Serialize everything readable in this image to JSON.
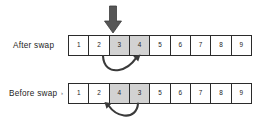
{
  "diagram": {
    "background_color": "#ffffff",
    "border_color": "#2b2b2b",
    "shaded_cell_color": "#d2d2d2",
    "arrow_color": "#4d4d4d",
    "curve_arrow_color": "#3a3a3a",
    "label_tick": "›"
  },
  "rows": [
    {
      "id": "after",
      "label": "After swap",
      "cells": [
        {
          "value": "1",
          "shaded": false
        },
        {
          "value": "2",
          "shaded": false
        },
        {
          "value": "3",
          "shaded": true
        },
        {
          "value": "4",
          "shaded": true
        },
        {
          "value": "5",
          "shaded": false
        },
        {
          "value": "6",
          "shaded": false
        },
        {
          "value": "7",
          "shaded": false
        },
        {
          "value": "8",
          "shaded": false
        },
        {
          "value": "9",
          "shaded": false
        }
      ]
    },
    {
      "id": "before",
      "label": "Before swap",
      "cells": [
        {
          "value": "1",
          "shaded": false
        },
        {
          "value": "2",
          "shaded": false
        },
        {
          "value": "4",
          "shaded": true
        },
        {
          "value": "3",
          "shaded": true
        },
        {
          "value": "5",
          "shaded": false
        },
        {
          "value": "6",
          "shaded": false
        },
        {
          "value": "7",
          "shaded": false
        },
        {
          "value": "8",
          "shaded": false
        },
        {
          "value": "9",
          "shaded": false
        }
      ]
    }
  ],
  "annotations": {
    "down_arrow": {
      "name": "down-arrow-pointer",
      "points_at_cell_index": 2,
      "direction": "down"
    },
    "curve_after": {
      "name": "curved-arrow-up-right",
      "direction": "up-right"
    },
    "curve_before": {
      "name": "curved-arrow-up-left",
      "direction": "up-left"
    }
  }
}
